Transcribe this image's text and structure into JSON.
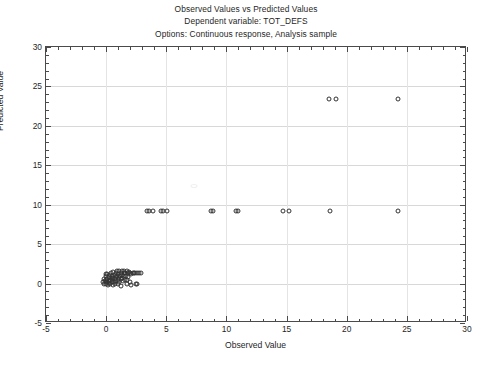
{
  "titles": {
    "line1": "Observed Values vs Predicted Values",
    "line2": "Dependent variable: TOT_DEFS",
    "line3": "Options: Continuous response, Analysis sample"
  },
  "chart_data": {
    "type": "scatter",
    "title": "Observed Values vs Predicted Values",
    "subtitle": "Dependent variable: TOT_DEFS",
    "note": "Options: Continuous response, Analysis sample",
    "xlabel": "Observed Value",
    "ylabel": "Predicted Value",
    "xlim": [
      -5,
      30
    ],
    "ylim": [
      -5,
      30
    ],
    "xticks": [
      -5,
      0,
      5,
      10,
      15,
      20,
      25,
      30
    ],
    "yticks": [
      -5,
      0,
      5,
      10,
      15,
      20,
      25,
      30
    ],
    "xtick_labels": [
      "-5",
      "0",
      "5",
      "10",
      "15",
      "20",
      "25",
      "30"
    ],
    "ytick_labels": [
      "-5",
      "0",
      "5",
      "10",
      "15",
      "20",
      "25",
      "30"
    ],
    "minor_tick_interval": 1,
    "grid": true,
    "legend": null,
    "marker": "open-circle",
    "marker_color": "#333333",
    "series": [
      {
        "name": "Observations",
        "points": [
          [
            -0.25,
            0.15
          ],
          [
            -0.2,
            0.55
          ],
          [
            -0.15,
            -0.1
          ],
          [
            -0.1,
            0.3
          ],
          [
            -0.05,
            1.2
          ],
          [
            0.0,
            0.0
          ],
          [
            0.0,
            0.45
          ],
          [
            0.0,
            0.9
          ],
          [
            0.05,
            0.15
          ],
          [
            0.1,
            0.6
          ],
          [
            0.1,
            1.25
          ],
          [
            0.15,
            -0.2
          ],
          [
            0.2,
            0.35
          ],
          [
            0.2,
            0.8
          ],
          [
            0.25,
            0.1
          ],
          [
            0.3,
            1.1
          ],
          [
            0.3,
            0.5
          ],
          [
            0.35,
            -0.05
          ],
          [
            0.4,
            0.65
          ],
          [
            0.4,
            1.35
          ],
          [
            0.45,
            0.2
          ],
          [
            0.5,
            0.95
          ],
          [
            0.5,
            0.4
          ],
          [
            0.55,
            -0.15
          ],
          [
            0.6,
            1.45
          ],
          [
            0.6,
            0.7
          ],
          [
            0.65,
            0.25
          ],
          [
            0.7,
            1.05
          ],
          [
            0.7,
            0.55
          ],
          [
            0.75,
            0.0
          ],
          [
            0.8,
            1.3
          ],
          [
            0.8,
            0.8
          ],
          [
            0.85,
            0.35
          ],
          [
            0.9,
            1.55
          ],
          [
            0.9,
            1.0
          ],
          [
            0.95,
            0.45
          ],
          [
            1.0,
            -0.1
          ],
          [
            1.0,
            1.2
          ],
          [
            1.05,
            0.7
          ],
          [
            1.1,
            1.6
          ],
          [
            1.1,
            0.25
          ],
          [
            1.15,
            1.0
          ],
          [
            1.2,
            1.4
          ],
          [
            1.2,
            0.55
          ],
          [
            1.25,
            -0.25
          ],
          [
            1.3,
            1.15
          ],
          [
            1.35,
            1.55
          ],
          [
            1.35,
            0.75
          ],
          [
            1.4,
            0.3
          ],
          [
            1.45,
            1.3
          ],
          [
            1.5,
            1.65
          ],
          [
            1.5,
            0.9
          ],
          [
            1.55,
            0.4
          ],
          [
            1.6,
            1.35
          ],
          [
            1.65,
            1.0
          ],
          [
            1.7,
            1.6
          ],
          [
            1.7,
            0.5
          ],
          [
            1.75,
            -0.05
          ],
          [
            1.8,
            1.3
          ],
          [
            1.85,
            0.85
          ],
          [
            1.9,
            1.5
          ],
          [
            1.95,
            0.2
          ],
          [
            2.0,
            1.35
          ],
          [
            2.05,
            -0.2
          ],
          [
            2.1,
            1.25
          ],
          [
            2.2,
            1.4
          ],
          [
            2.3,
            1.3
          ],
          [
            2.4,
            1.35
          ],
          [
            2.5,
            -0.1
          ],
          [
            2.6,
            1.35
          ],
          [
            2.7,
            1.3
          ],
          [
            2.9,
            1.35
          ],
          [
            2.6,
            -0.1
          ],
          [
            3.4,
            9.2
          ],
          [
            3.55,
            9.2
          ],
          [
            3.9,
            9.2
          ],
          [
            4.6,
            9.2
          ],
          [
            4.75,
            9.2
          ],
          [
            5.1,
            9.2
          ],
          [
            8.7,
            9.2
          ],
          [
            8.9,
            9.2
          ],
          [
            10.8,
            9.2
          ],
          [
            11.0,
            9.2
          ],
          [
            14.7,
            9.2
          ],
          [
            15.2,
            9.2
          ],
          [
            18.6,
            9.2
          ],
          [
            24.3,
            9.2
          ],
          [
            18.5,
            23.4
          ],
          [
            19.1,
            23.4
          ],
          [
            24.3,
            23.4
          ]
        ]
      }
    ]
  }
}
